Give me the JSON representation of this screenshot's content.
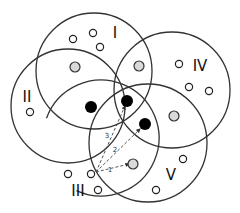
{
  "diagram": {
    "regions": [
      {
        "id": "I",
        "label": "I",
        "cx": 94,
        "cy": 71,
        "r": 58,
        "label_x": 115,
        "label_y": 33
      },
      {
        "id": "II",
        "label": "II",
        "cx": 68,
        "cy": 106,
        "r": 57,
        "label_x": 27,
        "label_y": 97
      },
      {
        "id": "III",
        "label": "III",
        "cx": 101,
        "cy": 138,
        "r": 58,
        "label_x": 78,
        "label_y": 191
      },
      {
        "id": "IV",
        "label": "IV",
        "cx": 172,
        "cy": 90,
        "r": 58,
        "label_x": 200,
        "label_y": 66
      },
      {
        "id": "V",
        "label": "V",
        "cx": 148,
        "cy": 143,
        "r": 59,
        "label_x": 171,
        "label_y": 175
      }
    ],
    "open_nodes": [
      {
        "x": 73,
        "y": 39
      },
      {
        "x": 93,
        "y": 33
      },
      {
        "x": 100,
        "y": 47
      },
      {
        "x": 30,
        "y": 112
      },
      {
        "x": 68,
        "y": 174
      },
      {
        "x": 91,
        "y": 174
      },
      {
        "x": 98,
        "y": 190
      },
      {
        "x": 179,
        "y": 64
      },
      {
        "x": 189,
        "y": 87
      },
      {
        "x": 209,
        "y": 91
      },
      {
        "x": 183,
        "y": 159
      },
      {
        "x": 156,
        "y": 190
      }
    ],
    "gray_nodes": [
      {
        "x": 75,
        "y": 67
      },
      {
        "x": 139,
        "y": 66
      },
      {
        "x": 174,
        "y": 116
      },
      {
        "x": 133,
        "y": 164
      }
    ],
    "black_nodes": [
      {
        "x": 91,
        "y": 107
      },
      {
        "x": 127,
        "y": 101
      },
      {
        "x": 145,
        "y": 124
      }
    ],
    "arrows": [
      {
        "label": "1",
        "from": [
          96,
          172
        ],
        "to": [
          129,
          164
        ],
        "label_x": 110,
        "label_y": 170
      },
      {
        "label": "2",
        "from": [
          96,
          172
        ],
        "to": [
          140,
          129
        ],
        "label_x": 115,
        "label_y": 150
      },
      {
        "label": "3",
        "from": [
          96,
          172
        ],
        "to": [
          125,
          106
        ],
        "label_x": 107,
        "label_y": 136
      }
    ],
    "colors": {
      "stroke": "#333333",
      "gray_fill": "#d9d9d9",
      "black_fill": "#000000"
    }
  }
}
